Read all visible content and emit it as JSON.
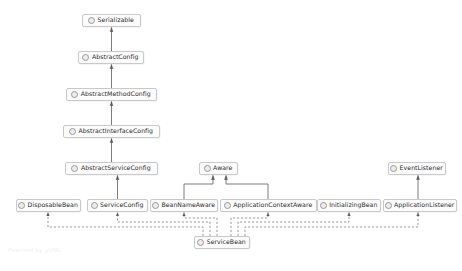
{
  "diagram": {
    "type": "uml-class-diagram",
    "title": "",
    "background_color": "#ffffff",
    "node_fill": "#fbfbfb",
    "node_border": "#c9c9c9",
    "line_color": "#6e6e6e",
    "watermark": "Powered by yUML",
    "icon_name": "interface-circle-icon",
    "nodes": [
      {
        "id": "serializable",
        "label": "Serializable",
        "x": 82,
        "y": 14,
        "w": 59,
        "stereotype": "interface"
      },
      {
        "id": "abstract-config",
        "label": "AbstractConfig",
        "x": 78,
        "y": 51,
        "w": 66,
        "stereotype": "class"
      },
      {
        "id": "abstract-method-config",
        "label": "AbstractMethodConfig",
        "x": 66,
        "y": 88,
        "w": 91,
        "stereotype": "class"
      },
      {
        "id": "abstract-interface-config",
        "label": "AbstractInterfaceConfig",
        "x": 63,
        "y": 125,
        "w": 97,
        "stereotype": "class"
      },
      {
        "id": "abstract-service-config",
        "label": "AbstractServiceConfig",
        "x": 65,
        "y": 162,
        "w": 93,
        "stereotype": "class"
      },
      {
        "id": "aware",
        "label": "Aware",
        "x": 199,
        "y": 162,
        "w": 39,
        "stereotype": "interface"
      },
      {
        "id": "event-listener",
        "label": "EventListener",
        "x": 388,
        "y": 162,
        "w": 58,
        "stereotype": "interface"
      },
      {
        "id": "disposable-bean",
        "label": "DisposableBean",
        "x": 16,
        "y": 199,
        "w": 65,
        "stereotype": "interface"
      },
      {
        "id": "service-config",
        "label": "ServiceConfig",
        "x": 87,
        "y": 199,
        "w": 61,
        "stereotype": "class"
      },
      {
        "id": "bean-name-aware",
        "label": "BeanNameAware",
        "x": 150,
        "y": 199,
        "w": 68,
        "stereotype": "interface"
      },
      {
        "id": "application-context-aware",
        "label": "ApplicationContextAware",
        "x": 220,
        "y": 199,
        "w": 97,
        "stereotype": "interface"
      },
      {
        "id": "initializing-bean",
        "label": "InitializingBean",
        "x": 317,
        "y": 199,
        "w": 64,
        "stereotype": "interface"
      },
      {
        "id": "application-listener",
        "label": "ApplicationListener",
        "x": 383,
        "y": 199,
        "w": 74,
        "stereotype": "interface"
      },
      {
        "id": "service-bean",
        "label": "ServiceBean",
        "x": 194,
        "y": 236,
        "w": 56,
        "stereotype": "class"
      }
    ],
    "edges": [
      {
        "from": "abstract-config",
        "to": "serializable",
        "style": "solid",
        "arrow": "generalization"
      },
      {
        "from": "abstract-method-config",
        "to": "abstract-config",
        "style": "solid",
        "arrow": "generalization"
      },
      {
        "from": "abstract-interface-config",
        "to": "abstract-method-config",
        "style": "solid",
        "arrow": "generalization"
      },
      {
        "from": "abstract-service-config",
        "to": "abstract-interface-config",
        "style": "solid",
        "arrow": "generalization"
      },
      {
        "from": "service-config",
        "to": "abstract-service-config",
        "style": "solid",
        "arrow": "generalization"
      },
      {
        "from": "bean-name-aware",
        "to": "aware",
        "style": "solid",
        "arrow": "generalization"
      },
      {
        "from": "application-context-aware",
        "to": "aware",
        "style": "solid",
        "arrow": "generalization"
      },
      {
        "from": "application-listener",
        "to": "event-listener",
        "style": "solid",
        "arrow": "generalization"
      },
      {
        "from": "service-bean",
        "to": "disposable-bean",
        "style": "dashed",
        "arrow": "realization"
      },
      {
        "from": "service-bean",
        "to": "service-config",
        "style": "dashed",
        "arrow": "realization"
      },
      {
        "from": "service-bean",
        "to": "bean-name-aware",
        "style": "dashed",
        "arrow": "realization"
      },
      {
        "from": "service-bean",
        "to": "application-context-aware",
        "style": "dashed",
        "arrow": "realization"
      },
      {
        "from": "service-bean",
        "to": "initializing-bean",
        "style": "dashed",
        "arrow": "realization"
      },
      {
        "from": "service-bean",
        "to": "application-listener",
        "style": "dashed",
        "arrow": "realization"
      }
    ]
  }
}
